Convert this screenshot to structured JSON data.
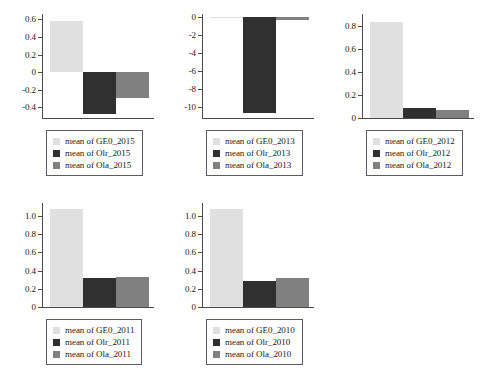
{
  "figure": {
    "background_color": "#ffffff",
    "axis_color": "#4a4a4a",
    "legend_border_color": "#5b5b6b",
    "series_colors": {
      "GE0": "#e0e0e0",
      "Olr": "#303030",
      "Ola": "#808080"
    }
  },
  "chart_data": [
    {
      "type": "bar",
      "title": "",
      "xlabel": "",
      "ylabel": "",
      "categories": [
        "mean of GE0_2015",
        "mean of Olr_2015",
        "mean of Ola_2015"
      ],
      "values": [
        0.58,
        -0.48,
        -0.29
      ],
      "colors": [
        "#e0e0e0",
        "#303030",
        "#808080"
      ],
      "ylim": [
        -0.52,
        0.66
      ],
      "yticks": [
        0.6,
        0.4,
        0.2,
        0,
        -0.2,
        -0.4
      ],
      "ytick_labels": [
        "0.6",
        "0.4",
        "0.2",
        "0",
        "-0.2",
        "-0.4"
      ],
      "grid": false,
      "legend_position": "below",
      "legend": [
        {
          "label": "mean of GE0_2015",
          "color": "#e0e0e0"
        },
        {
          "label": "mean of Olr_2015",
          "color": "#303030"
        },
        {
          "label": "mean of Ola_2015",
          "color": "#808080"
        }
      ]
    },
    {
      "type": "bar",
      "title": "",
      "xlabel": "",
      "ylabel": "",
      "categories": [
        "mean of GE0_2013",
        "mean of Olr_2013",
        "mean of Ola_2013"
      ],
      "values": [
        -0.05,
        -10.7,
        -0.3
      ],
      "colors": [
        "#e0e0e0",
        "#303030",
        "#808080"
      ],
      "ylim": [
        -11.2,
        0.35
      ],
      "yticks": [
        0,
        -2,
        -4,
        -6,
        -8,
        -10
      ],
      "ytick_labels": [
        "0",
        "-2",
        "-4",
        "-6",
        "-8",
        "-10"
      ],
      "grid": false,
      "legend_position": "below",
      "legend": [
        {
          "label": "mean of GE0_2013",
          "color": "#e0e0e0"
        },
        {
          "label": "mean of Olr_2013",
          "color": "#303030"
        },
        {
          "label": "mean of Ola_2013",
          "color": "#808080"
        }
      ]
    },
    {
      "type": "bar",
      "title": "",
      "xlabel": "",
      "ylabel": "",
      "categories": [
        "mean of GE0_2012",
        "mean of Olr_2012",
        "mean of Ola_2012"
      ],
      "values": [
        0.83,
        0.085,
        0.065
      ],
      "colors": [
        "#e0e0e0",
        "#303030",
        "#808080"
      ],
      "ylim": [
        0,
        0.9
      ],
      "yticks": [
        0.8,
        0.6,
        0.4,
        0.2,
        0
      ],
      "ytick_labels": [
        "0.8",
        "0.6",
        "0.4",
        "0.2",
        "0"
      ],
      "grid": false,
      "legend_position": "below",
      "legend": [
        {
          "label": "mean of GE0_2012",
          "color": "#e0e0e0"
        },
        {
          "label": "mean of Olr_2012",
          "color": "#303030"
        },
        {
          "label": "mean of Ola_2012",
          "color": "#808080"
        }
      ]
    },
    {
      "type": "bar",
      "title": "",
      "xlabel": "",
      "ylabel": "",
      "categories": [
        "mean of GE0_2011",
        "mean of Olr_2011",
        "mean of Ola_2011"
      ],
      "values": [
        1.07,
        0.315,
        0.33
      ],
      "colors": [
        "#e0e0e0",
        "#303030",
        "#808080"
      ],
      "ylim": [
        0,
        1.14
      ],
      "yticks": [
        1.0,
        0.8,
        0.6,
        0.4,
        0.2,
        0
      ],
      "ytick_labels": [
        "1.0",
        "0.8",
        "0.6",
        "0.4",
        "0.2",
        "0"
      ],
      "grid": false,
      "legend_position": "below",
      "legend": [
        {
          "label": "mean of GE0_2011",
          "color": "#e0e0e0"
        },
        {
          "label": "mean of Olr_2011",
          "color": "#303030"
        },
        {
          "label": "mean of Ola_2011",
          "color": "#808080"
        }
      ]
    },
    {
      "type": "bar",
      "title": "",
      "xlabel": "",
      "ylabel": "",
      "categories": [
        "mean of GE0_2010",
        "mean of Olr_2010",
        "mean of Ola_2010"
      ],
      "values": [
        1.07,
        0.29,
        0.315
      ],
      "colors": [
        "#e0e0e0",
        "#303030",
        "#808080"
      ],
      "ylim": [
        0,
        1.14
      ],
      "yticks": [
        1.0,
        0.8,
        0.6,
        0.4,
        0.2,
        0
      ],
      "ytick_labels": [
        "1.0",
        "0.8",
        "0.6",
        "0.4",
        "0.2",
        "0"
      ],
      "grid": false,
      "legend_position": "below",
      "legend": [
        {
          "label": "mean of GE0_2010",
          "color": "#e0e0e0"
        },
        {
          "label": "mean of Olr_2010",
          "color": "#303030"
        },
        {
          "label": "mean of Ola_2010",
          "color": "#808080"
        }
      ]
    }
  ]
}
